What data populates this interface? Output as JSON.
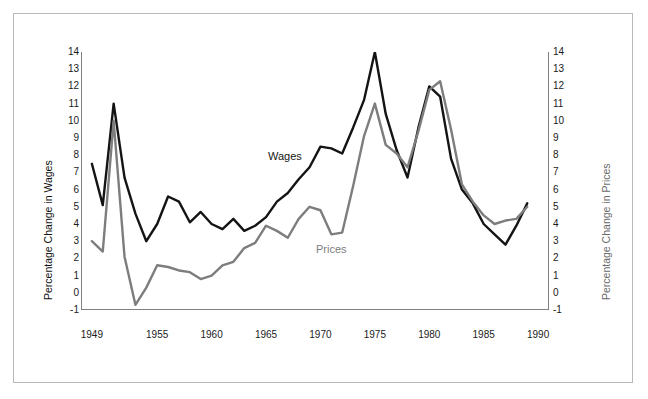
{
  "figure": {
    "background_color": "#ffffff",
    "frame_color": "#b9b9b9"
  },
  "chart_data": {
    "type": "line",
    "title": "",
    "xlabel": "",
    "ylabel": "Percentage Change in Wages",
    "ylabel_right": "Percentage Change in Prices",
    "xlim": [
      1948,
      1991
    ],
    "ylim": [
      -1,
      14
    ],
    "ylim_right": [
      -1,
      14
    ],
    "grid": false,
    "legend_position": "inline-annotations",
    "xticks": [
      1949,
      1955,
      1960,
      1965,
      1970,
      1975,
      1980,
      1985,
      1990
    ],
    "xticklabels": [
      "1949",
      "1955",
      "1960",
      "1965",
      "1970",
      "1975",
      "1980",
      "1985",
      "1990"
    ],
    "yticks": [
      -1,
      0,
      1,
      2,
      3,
      4,
      5,
      6,
      7,
      8,
      9,
      10,
      11,
      12,
      13,
      14
    ],
    "yticklabels": [
      "-1",
      "0",
      "1",
      "2",
      "3",
      "4",
      "5",
      "6",
      "7",
      "8",
      "9",
      "10",
      "11",
      "12",
      "13",
      "14"
    ],
    "yticks_right": [
      -1,
      0,
      1,
      2,
      3,
      4,
      5,
      6,
      7,
      8,
      9,
      10,
      11,
      12,
      13,
      14
    ],
    "yticklabels_right": [
      "-1",
      "0",
      "1",
      "2",
      "3",
      "4",
      "5",
      "6",
      "7",
      "8",
      "9",
      "10",
      "11",
      "12",
      "13",
      "14"
    ],
    "series": [
      {
        "name": "Wages",
        "color": "#141414",
        "linewidth": 2.4,
        "label_text": "Wages",
        "x": [
          1949,
          1950,
          1951,
          1952,
          1953,
          1954,
          1955,
          1956,
          1957,
          1958,
          1959,
          1960,
          1961,
          1962,
          1963,
          1964,
          1965,
          1966,
          1967,
          1968,
          1969,
          1970,
          1971,
          1972,
          1973,
          1974,
          1975,
          1976,
          1977,
          1978,
          1979,
          1980,
          1981,
          1982,
          1983,
          1984,
          1985,
          1986,
          1987,
          1988,
          1989
        ],
        "values": [
          7.5,
          5.1,
          11.0,
          6.7,
          4.6,
          3.0,
          4.0,
          5.6,
          5.3,
          4.1,
          4.7,
          4.0,
          3.7,
          4.3,
          3.6,
          3.9,
          4.4,
          5.3,
          5.8,
          6.6,
          7.3,
          8.5,
          8.4,
          8.1,
          9.6,
          11.2,
          14.0,
          10.4,
          8.3,
          6.7,
          9.6,
          12.0,
          11.4,
          7.8,
          6.0,
          5.2,
          4.0,
          3.4,
          2.8,
          3.9,
          5.2
        ]
      },
      {
        "name": "Prices",
        "color": "#7d7d7d",
        "linewidth": 2.4,
        "label_text": "Prices",
        "x": [
          1949,
          1950,
          1951,
          1952,
          1953,
          1954,
          1955,
          1956,
          1957,
          1958,
          1959,
          1960,
          1961,
          1962,
          1963,
          1964,
          1965,
          1966,
          1967,
          1968,
          1969,
          1970,
          1971,
          1972,
          1973,
          1974,
          1975,
          1976,
          1977,
          1978,
          1979,
          1980,
          1981,
          1982,
          1983,
          1984,
          1985,
          1986,
          1987,
          1988,
          1989
        ],
        "values": [
          3.0,
          2.4,
          10.0,
          2.1,
          -0.7,
          0.3,
          1.6,
          1.5,
          1.3,
          1.2,
          0.8,
          1.0,
          1.6,
          1.8,
          2.6,
          2.9,
          3.9,
          3.6,
          3.2,
          4.3,
          5.0,
          4.8,
          3.4,
          3.5,
          6.2,
          9.1,
          11.0,
          8.6,
          8.1,
          7.3,
          9.4,
          11.8,
          12.3,
          9.5,
          6.3,
          5.3,
          4.5,
          4.0,
          4.2,
          4.3,
          5.0
        ]
      }
    ]
  },
  "axes": {
    "left_title": "Percentage Change in Wages",
    "right_title": "Percentage Change in Prices"
  },
  "annotations": [
    {
      "name": "wages-label",
      "text": "Wages",
      "color": "#151515"
    },
    {
      "name": "prices-label",
      "text": "Prices",
      "color": "#7d7d7d"
    }
  ]
}
